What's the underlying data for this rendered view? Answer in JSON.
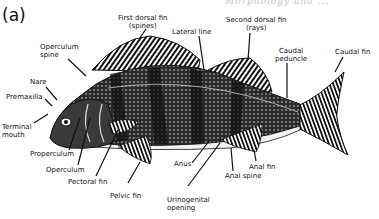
{
  "figure": {
    "panel_label": "(a)",
    "top_clipped_text": "Morphology and ..."
  },
  "labels": [
    {
      "id": "first-dorsal-fin",
      "line1": "First dorsal fin",
      "line2": "(spines)"
    },
    {
      "id": "lateral-line",
      "line1": "Lateral line"
    },
    {
      "id": "second-dorsal-fin",
      "line1": "Second dorsal fin",
      "line2": "(rays)"
    },
    {
      "id": "operculum-spine",
      "line1": "Operculum",
      "line2": "spine"
    },
    {
      "id": "caudal-peduncle",
      "line1": "Caudal",
      "line2": "peduncle"
    },
    {
      "id": "caudal-fin",
      "line1": "Caudal fin"
    },
    {
      "id": "nare",
      "line1": "Nare"
    },
    {
      "id": "premaxilla",
      "line1": "Premaxilla"
    },
    {
      "id": "terminal-mouth",
      "line1": "Terminal",
      "line2": "mouth"
    },
    {
      "id": "properculum",
      "line1": "Properculum"
    },
    {
      "id": "operculum",
      "line1": "Operculum"
    },
    {
      "id": "pectoral-fin",
      "line1": "Pectoral fin"
    },
    {
      "id": "pelvic-fin",
      "line1": "Pelvic fin"
    },
    {
      "id": "anus",
      "line1": "Anus"
    },
    {
      "id": "urinogenital-opening",
      "line1": "Urinogenital",
      "line2": "opening"
    },
    {
      "id": "anal-spine",
      "line1": "Anal spine"
    },
    {
      "id": "anal-fin",
      "line1": "Anal fin"
    }
  ],
  "colors": {
    "ink": "#111111",
    "background": "#ffffff"
  }
}
